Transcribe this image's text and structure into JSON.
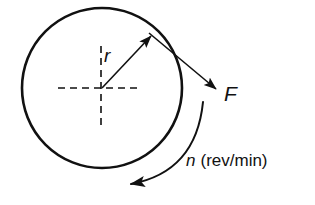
{
  "figure": {
    "background_color": "#ffffff",
    "stroke_color": "#111111",
    "width": 315,
    "height": 205
  },
  "labels": {
    "radius": "r",
    "force": "F",
    "speed_symbol": "n",
    "speed_units": "(rev/min)",
    "speed_full": "n (rev/min)"
  },
  "geometry": {
    "circle": {
      "cx": 102,
      "cy": 88,
      "r": 80,
      "stroke_width": 2.6
    },
    "center_crosshair": {
      "horizontal": {
        "x1": 58,
        "y1": 88,
        "x2": 141,
        "y2": 88
      },
      "vertical": {
        "x1": 101,
        "y1": 46,
        "x2": 101,
        "y2": 129
      },
      "dash": "7 5",
      "stroke_width": 1.6
    },
    "radius_arrow": {
      "x1": 102,
      "y1": 88,
      "x2": 151,
      "y2": 36,
      "stroke_width": 1.6
    },
    "force_arrow": {
      "x1": 149,
      "y1": 33,
      "x2": 216,
      "y2": 89,
      "stroke_width": 1.6
    },
    "rotation_arc": {
      "start_x": 203,
      "start_y": 102,
      "control_x": 196,
      "control_y": 172,
      "end_x": 131,
      "end_y": 184,
      "stroke_width": 2.0
    }
  },
  "label_positions": {
    "radius": {
      "x": 104,
      "y": 62,
      "font_size": 19
    },
    "force": {
      "x": 224,
      "y": 101,
      "font_size": 21
    },
    "speed": {
      "x": 186,
      "y": 166,
      "font_size": 17
    }
  }
}
